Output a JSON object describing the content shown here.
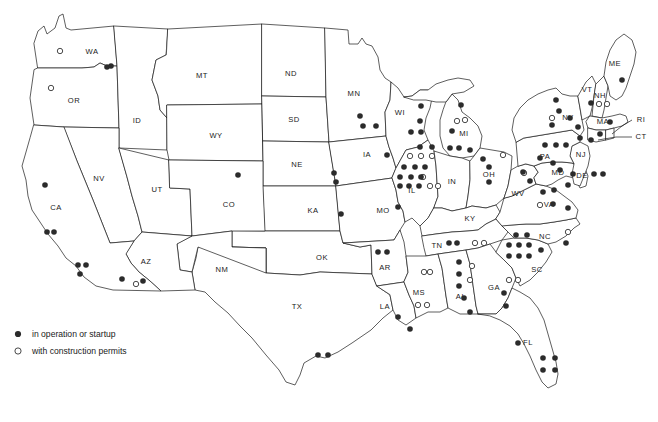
{
  "figure": {
    "kind": "thematic-point-map",
    "region": "contiguous-united-states"
  },
  "legend": {
    "items": [
      {
        "symbol": "filled-dot",
        "label": "in operation or startup"
      },
      {
        "symbol": "open-circle",
        "label": "with construction permits"
      }
    ]
  },
  "colors": {
    "ink": "#1a1a1a",
    "marker_fill": "#2b2b2b",
    "background": "#ffffff"
  },
  "state_labels": [
    {
      "code": "WA",
      "x": 92,
      "y": 52
    },
    {
      "code": "OR",
      "x": 74,
      "y": 101
    },
    {
      "code": "ID",
      "x": 137,
      "y": 121
    },
    {
      "code": "MT",
      "x": 202,
      "y": 76
    },
    {
      "code": "WY",
      "x": 216,
      "y": 136
    },
    {
      "code": "ND",
      "x": 291,
      "y": 74
    },
    {
      "code": "SD",
      "x": 294,
      "y": 120
    },
    {
      "code": "NE",
      "x": 297,
      "y": 165
    },
    {
      "code": "KA",
      "x": 313,
      "y": 211
    },
    {
      "code": "OK",
      "x": 322,
      "y": 258
    },
    {
      "code": "TX",
      "x": 297,
      "y": 307
    },
    {
      "code": "NV",
      "x": 99,
      "y": 179
    },
    {
      "code": "UT",
      "x": 157,
      "y": 190
    },
    {
      "code": "CO",
      "x": 229,
      "y": 205
    },
    {
      "code": "NM",
      "x": 222,
      "y": 270
    },
    {
      "code": "AZ",
      "x": 146,
      "y": 262
    },
    {
      "code": "CA",
      "x": 56,
      "y": 208
    },
    {
      "code": "MN",
      "x": 354,
      "y": 94
    },
    {
      "code": "IA",
      "x": 367,
      "y": 155
    },
    {
      "code": "MO",
      "x": 383,
      "y": 211
    },
    {
      "code": "AR",
      "x": 385,
      "y": 268
    },
    {
      "code": "LA",
      "x": 385,
      "y": 307
    },
    {
      "code": "WI",
      "x": 400,
      "y": 113
    },
    {
      "code": "IL",
      "x": 412,
      "y": 191
    },
    {
      "code": "MI",
      "x": 464,
      "y": 134
    },
    {
      "code": "IN",
      "x": 452,
      "y": 182
    },
    {
      "code": "OH",
      "x": 489,
      "y": 175
    },
    {
      "code": "KY",
      "x": 470,
      "y": 219
    },
    {
      "code": "TN",
      "x": 437,
      "y": 246
    },
    {
      "code": "MS",
      "x": 419,
      "y": 293
    },
    {
      "code": "AL",
      "x": 461,
      "y": 297
    },
    {
      "code": "GA",
      "x": 494,
      "y": 288
    },
    {
      "code": "FL",
      "x": 528,
      "y": 343
    },
    {
      "code": "SC",
      "x": 537,
      "y": 270
    },
    {
      "code": "NC",
      "x": 545,
      "y": 237
    },
    {
      "code": "VA",
      "x": 549,
      "y": 205
    },
    {
      "code": "WV",
      "x": 518,
      "y": 194
    },
    {
      "code": "MD",
      "x": 558,
      "y": 173
    },
    {
      "code": "DE",
      "x": 582,
      "y": 176
    },
    {
      "code": "NJ",
      "x": 581,
      "y": 155
    },
    {
      "code": "PA",
      "x": 545,
      "y": 157
    },
    {
      "code": "NY",
      "x": 568,
      "y": 118
    },
    {
      "code": "MA",
      "x": 603,
      "y": 122
    },
    {
      "code": "VT",
      "x": 587,
      "y": 90
    },
    {
      "code": "NH",
      "x": 600,
      "y": 96
    },
    {
      "code": "ME",
      "x": 615,
      "y": 64
    },
    {
      "code": "RI",
      "x": 641,
      "y": 120
    },
    {
      "code": "CT",
      "x": 641,
      "y": 137
    }
  ],
  "markers": {
    "in_operation": [
      {
        "x": 107,
        "y": 67
      },
      {
        "x": 111,
        "y": 66
      },
      {
        "x": 45,
        "y": 185
      },
      {
        "x": 47,
        "y": 232
      },
      {
        "x": 54,
        "y": 232
      },
      {
        "x": 78,
        "y": 265
      },
      {
        "x": 86,
        "y": 265
      },
      {
        "x": 80,
        "y": 274
      },
      {
        "x": 122,
        "y": 279
      },
      {
        "x": 143,
        "y": 281
      },
      {
        "x": 238,
        "y": 175
      },
      {
        "x": 334,
        "y": 173
      },
      {
        "x": 336,
        "y": 182
      },
      {
        "x": 341,
        "y": 214
      },
      {
        "x": 360,
        "y": 116
      },
      {
        "x": 363,
        "y": 126
      },
      {
        "x": 376,
        "y": 126
      },
      {
        "x": 387,
        "y": 155
      },
      {
        "x": 398,
        "y": 207
      },
      {
        "x": 421,
        "y": 106
      },
      {
        "x": 420,
        "y": 121
      },
      {
        "x": 411,
        "y": 132
      },
      {
        "x": 421,
        "y": 132
      },
      {
        "x": 420,
        "y": 147
      },
      {
        "x": 432,
        "y": 147
      },
      {
        "x": 404,
        "y": 167
      },
      {
        "x": 415,
        "y": 167
      },
      {
        "x": 425,
        "y": 167
      },
      {
        "x": 400,
        "y": 177
      },
      {
        "x": 411,
        "y": 177
      },
      {
        "x": 421,
        "y": 177
      },
      {
        "x": 400,
        "y": 186
      },
      {
        "x": 409,
        "y": 186
      },
      {
        "x": 419,
        "y": 186
      },
      {
        "x": 461,
        "y": 105
      },
      {
        "x": 452,
        "y": 131
      },
      {
        "x": 450,
        "y": 148
      },
      {
        "x": 459,
        "y": 148
      },
      {
        "x": 470,
        "y": 150
      },
      {
        "x": 489,
        "y": 167
      },
      {
        "x": 489,
        "y": 182
      },
      {
        "x": 483,
        "y": 159
      },
      {
        "x": 378,
        "y": 252
      },
      {
        "x": 387,
        "y": 252
      },
      {
        "x": 398,
        "y": 317
      },
      {
        "x": 410,
        "y": 329
      },
      {
        "x": 318,
        "y": 355
      },
      {
        "x": 328,
        "y": 355
      },
      {
        "x": 449,
        "y": 243
      },
      {
        "x": 457,
        "y": 243
      },
      {
        "x": 459,
        "y": 262
      },
      {
        "x": 459,
        "y": 274
      },
      {
        "x": 459,
        "y": 286
      },
      {
        "x": 464,
        "y": 298
      },
      {
        "x": 470,
        "y": 312
      },
      {
        "x": 504,
        "y": 293
      },
      {
        "x": 506,
        "y": 306
      },
      {
        "x": 516,
        "y": 235
      },
      {
        "x": 527,
        "y": 235
      },
      {
        "x": 509,
        "y": 245
      },
      {
        "x": 519,
        "y": 245
      },
      {
        "x": 529,
        "y": 245
      },
      {
        "x": 509,
        "y": 256
      },
      {
        "x": 519,
        "y": 256
      },
      {
        "x": 529,
        "y": 256
      },
      {
        "x": 541,
        "y": 250
      },
      {
        "x": 566,
        "y": 243
      },
      {
        "x": 518,
        "y": 343
      },
      {
        "x": 543,
        "y": 358
      },
      {
        "x": 555,
        "y": 358
      },
      {
        "x": 543,
        "y": 370
      },
      {
        "x": 555,
        "y": 370
      },
      {
        "x": 543,
        "y": 192
      },
      {
        "x": 554,
        "y": 190
      },
      {
        "x": 553,
        "y": 204
      },
      {
        "x": 568,
        "y": 208
      },
      {
        "x": 523,
        "y": 172
      },
      {
        "x": 530,
        "y": 181
      },
      {
        "x": 545,
        "y": 145
      },
      {
        "x": 556,
        "y": 145
      },
      {
        "x": 566,
        "y": 145
      },
      {
        "x": 540,
        "y": 158
      },
      {
        "x": 553,
        "y": 163
      },
      {
        "x": 560,
        "y": 170
      },
      {
        "x": 573,
        "y": 174
      },
      {
        "x": 568,
        "y": 185
      },
      {
        "x": 594,
        "y": 174
      },
      {
        "x": 603,
        "y": 174
      },
      {
        "x": 556,
        "y": 100
      },
      {
        "x": 559,
        "y": 111
      },
      {
        "x": 552,
        "y": 125
      },
      {
        "x": 570,
        "y": 118
      },
      {
        "x": 578,
        "y": 127
      },
      {
        "x": 580,
        "y": 138
      },
      {
        "x": 591,
        "y": 140
      },
      {
        "x": 600,
        "y": 134
      },
      {
        "x": 610,
        "y": 122
      },
      {
        "x": 591,
        "y": 103
      },
      {
        "x": 622,
        "y": 80
      }
    ],
    "construction_permits": [
      {
        "x": 60,
        "y": 51
      },
      {
        "x": 51,
        "y": 88
      },
      {
        "x": 136,
        "y": 284
      },
      {
        "x": 410,
        "y": 156
      },
      {
        "x": 421,
        "y": 156
      },
      {
        "x": 432,
        "y": 156
      },
      {
        "x": 423,
        "y": 177
      },
      {
        "x": 430,
        "y": 186
      },
      {
        "x": 438,
        "y": 186
      },
      {
        "x": 457,
        "y": 121
      },
      {
        "x": 465,
        "y": 120
      },
      {
        "x": 503,
        "y": 155
      },
      {
        "x": 524,
        "y": 173
      },
      {
        "x": 475,
        "y": 243
      },
      {
        "x": 484,
        "y": 243
      },
      {
        "x": 472,
        "y": 266
      },
      {
        "x": 470,
        "y": 280
      },
      {
        "x": 424,
        "y": 272
      },
      {
        "x": 430,
        "y": 272
      },
      {
        "x": 418,
        "y": 305
      },
      {
        "x": 427,
        "y": 305
      },
      {
        "x": 509,
        "y": 280
      },
      {
        "x": 518,
        "y": 280
      },
      {
        "x": 568,
        "y": 232
      },
      {
        "x": 540,
        "y": 205
      },
      {
        "x": 552,
        "y": 118
      },
      {
        "x": 599,
        "y": 104
      },
      {
        "x": 607,
        "y": 104
      }
    ]
  }
}
